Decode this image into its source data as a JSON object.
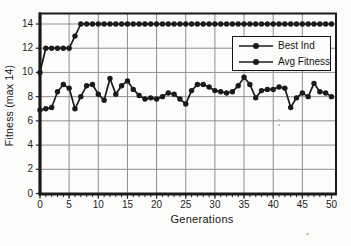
{
  "chart_data": {
    "type": "line",
    "title": "",
    "xlabel": "Generations",
    "ylabel": "Fitness (max 14)",
    "xlim": [
      0,
      50
    ],
    "ylim": [
      0,
      14
    ],
    "xticks": [
      0,
      5,
      10,
      15,
      20,
      25,
      30,
      35,
      40,
      45,
      50
    ],
    "yticks": [
      0,
      2,
      4,
      6,
      8,
      10,
      12,
      14
    ],
    "x_minor_tick_step": 1,
    "grid": true,
    "legend_position": "upper-right-inside",
    "x": [
      0,
      1,
      2,
      3,
      4,
      5,
      6,
      7,
      8,
      9,
      10,
      11,
      12,
      13,
      14,
      15,
      16,
      17,
      18,
      19,
      20,
      21,
      22,
      23,
      24,
      25,
      26,
      27,
      28,
      29,
      30,
      31,
      32,
      33,
      34,
      35,
      36,
      37,
      38,
      39,
      40,
      41,
      42,
      43,
      44,
      45,
      46,
      47,
      48,
      49,
      50
    ],
    "series": [
      {
        "name": "Best Ind",
        "marker": "dot",
        "color": "#1a1a1a",
        "values": [
          10,
          12,
          12,
          12,
          12,
          12,
          13,
          14,
          14,
          14,
          14,
          14,
          14,
          14,
          14,
          14,
          14,
          14,
          14,
          14,
          14,
          14,
          14,
          14,
          14,
          14,
          14,
          14,
          14,
          14,
          14,
          14,
          14,
          14,
          14,
          14,
          14,
          14,
          14,
          14,
          14,
          14,
          14,
          14,
          14,
          14,
          14,
          14,
          14,
          14,
          14
        ]
      },
      {
        "name": "Avg Fitness",
        "marker": "dot",
        "color": "#1a1a1a",
        "values": [
          6.9,
          7.0,
          7.1,
          8.4,
          9.0,
          8.7,
          7.0,
          8.0,
          8.9,
          9.0,
          8.2,
          7.7,
          9.5,
          8.2,
          8.9,
          9.3,
          8.6,
          8.1,
          7.8,
          7.9,
          7.8,
          8.0,
          8.3,
          8.2,
          7.8,
          7.4,
          8.5,
          9.0,
          9.0,
          8.8,
          8.5,
          8.4,
          8.3,
          8.4,
          8.9,
          9.6,
          9.0,
          7.9,
          8.5,
          8.6,
          8.6,
          8.8,
          8.7,
          7.1,
          7.9,
          8.3,
          8.0,
          9.1,
          8.4,
          8.3,
          8.0
        ]
      }
    ]
  },
  "colors": {
    "ink": "#1a1a1a",
    "grid": "#8e8e8e",
    "tick": "#2a2a2a",
    "paper": "#fcfcfb"
  }
}
